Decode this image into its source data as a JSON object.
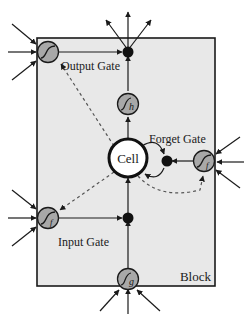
{
  "diagram": {
    "type": "lstm-memory-block",
    "block_label": "Block",
    "cell_label": "Cell",
    "gates": {
      "output": {
        "label": "Output Gate",
        "activation": "f"
      },
      "forget": {
        "label": "Forget Gate",
        "activation": "f"
      },
      "input": {
        "label": "Input Gate",
        "activation": "f"
      }
    },
    "squash_nodes": {
      "input_squash": {
        "subscript": "g"
      },
      "output_squash": {
        "subscript": "h"
      }
    },
    "colors": {
      "block_fill": "#e8e8e8",
      "node_fill": "#a8a8a8",
      "stroke": "#1a1a1a",
      "cell_fill": "#ffffff"
    }
  }
}
